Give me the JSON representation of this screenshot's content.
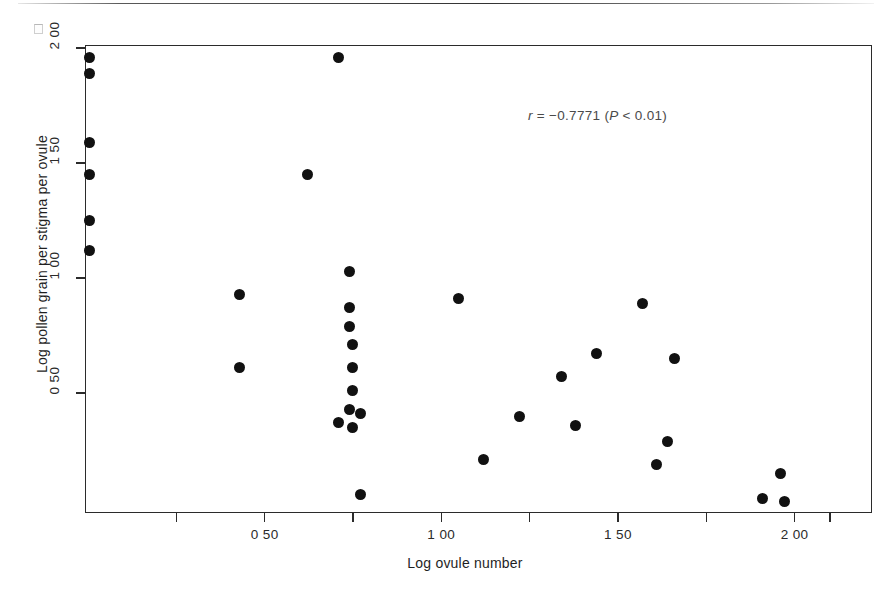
{
  "figure": {
    "background": "#ffffff",
    "marker_color": "#111111",
    "axis_color": "#2b2b2b"
  },
  "annotation": {
    "r_symbol": "r",
    "text": " = −0.7771 (",
    "p_symbol": "P",
    "tail": " < 0.01)",
    "full": "r = −0.7771 (P < 0.01)"
  },
  "chart_data": {
    "type": "scatter",
    "title": "",
    "xlabel": "Log ovule number",
    "ylabel": "Log pollen grain per stigma per ovule",
    "xlim": [
      -0.01,
      2.22
    ],
    "ylim": [
      0.0,
      2.04
    ],
    "grid": false,
    "legend": null,
    "xticks": [
      0.5,
      1.0,
      1.5,
      2.0
    ],
    "xticklabels": [
      "0 50",
      "1 00",
      "1 50",
      "2 00"
    ],
    "xtick_minor": [
      0.25,
      0.75,
      1.25,
      1.75,
      2.1
    ],
    "yticks": [
      0.5,
      1.0,
      1.5,
      2.0
    ],
    "yticklabels": [
      "0 50",
      "1 00",
      "1 50",
      "2 00"
    ],
    "correlation_r": -0.7771,
    "p_value_text": "P < 0.01",
    "n_points": 33,
    "points": [
      {
        "x": 0.005,
        "y": 1.96
      },
      {
        "x": 0.005,
        "y": 1.89
      },
      {
        "x": 0.005,
        "y": 1.59
      },
      {
        "x": 0.005,
        "y": 1.45
      },
      {
        "x": 0.005,
        "y": 1.25
      },
      {
        "x": 0.005,
        "y": 1.12
      },
      {
        "x": 0.71,
        "y": 1.96
      },
      {
        "x": 0.62,
        "y": 1.45
      },
      {
        "x": 0.43,
        "y": 0.93
      },
      {
        "x": 0.43,
        "y": 0.61
      },
      {
        "x": 0.74,
        "y": 1.03
      },
      {
        "x": 0.74,
        "y": 0.87
      },
      {
        "x": 0.74,
        "y": 0.79
      },
      {
        "x": 0.75,
        "y": 0.71
      },
      {
        "x": 0.75,
        "y": 0.61
      },
      {
        "x": 0.75,
        "y": 0.51
      },
      {
        "x": 0.74,
        "y": 0.43
      },
      {
        "x": 0.77,
        "y": 0.41
      },
      {
        "x": 0.71,
        "y": 0.37
      },
      {
        "x": 0.75,
        "y": 0.35
      },
      {
        "x": 0.77,
        "y": 0.06
      },
      {
        "x": 1.05,
        "y": 0.91
      },
      {
        "x": 1.57,
        "y": 0.89
      },
      {
        "x": 1.44,
        "y": 0.67
      },
      {
        "x": 1.66,
        "y": 0.65
      },
      {
        "x": 1.34,
        "y": 0.57
      },
      {
        "x": 1.22,
        "y": 0.4
      },
      {
        "x": 1.38,
        "y": 0.36
      },
      {
        "x": 1.64,
        "y": 0.29
      },
      {
        "x": 1.12,
        "y": 0.21
      },
      {
        "x": 1.61,
        "y": 0.19
      },
      {
        "x": 1.96,
        "y": 0.15
      },
      {
        "x": 1.91,
        "y": 0.04
      },
      {
        "x": 1.97,
        "y": 0.03
      }
    ]
  }
}
